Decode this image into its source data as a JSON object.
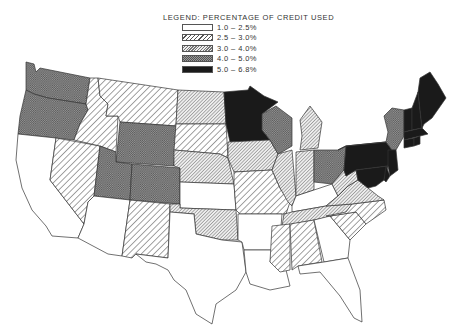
{
  "legend": {
    "title": "LEGEND:  PERCENTAGE OF CREDIT USED",
    "classes": [
      {
        "id": "c1",
        "label": "1.0  –  2.5%",
        "pattern": "blank",
        "range": [
          1.0,
          2.5
        ]
      },
      {
        "id": "c2",
        "label": "2.5  –  3.0%",
        "pattern": "wide-diagonal",
        "range": [
          2.5,
          3.0
        ]
      },
      {
        "id": "c3",
        "label": "3.0  –  4.0%",
        "pattern": "fine-diagonal",
        "range": [
          3.0,
          4.0
        ]
      },
      {
        "id": "c4",
        "label": "4.0  –  5.0%",
        "pattern": "crosshatch",
        "range": [
          4.0,
          5.0
        ]
      },
      {
        "id": "c5",
        "label": "5.0  –  6.8%",
        "pattern": "solid-black",
        "range": [
          5.0,
          6.8
        ]
      }
    ]
  },
  "chart_data": {
    "type": "choropleth",
    "title": "Percentage of Credit Used",
    "legend_position": "top-center",
    "states": {
      "WA": "c4",
      "OR": "c4",
      "CA": "c1",
      "NV": "c2",
      "ID": "c2",
      "MT": "c2",
      "WY": "c4",
      "UT": "c4",
      "CO": "c4",
      "AZ": "c1",
      "NM": "c2",
      "ND": "c3",
      "SD": "c2",
      "NE": "c3",
      "KS": "c1",
      "OK": "c3",
      "TX": "c1",
      "MN": "c5",
      "IA": "c3",
      "MO": "c2",
      "AR": "c1",
      "LA": "c1",
      "WI": "c4",
      "IL": "c3",
      "MI": "c3",
      "IN": "c3",
      "OH": "c4",
      "KY": "c1",
      "TN": "c3",
      "MS": "c2",
      "AL": "c2",
      "GA": "c1",
      "FL": "c1",
      "SC": "c2",
      "NC": "c2",
      "VA": "c3",
      "WV": "c3",
      "PA": "c5",
      "NY": "c4",
      "NJ": "c5",
      "MD": "c5",
      "DE": "c5",
      "VT": "c5",
      "NH": "c5",
      "ME": "c5",
      "MA": "c5",
      "CT": "c5",
      "RI": "c5"
    }
  }
}
